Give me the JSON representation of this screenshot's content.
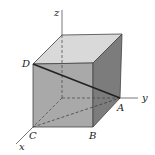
{
  "figure": {
    "type": "3d-cube-diagram",
    "axes": {
      "x": "x",
      "y": "y",
      "z": "z"
    },
    "points": {
      "A": "A",
      "B": "B",
      "C": "C",
      "D": "D"
    },
    "segments": [
      "DA",
      "CA"
    ],
    "colors": {
      "top_face": "#d9d9d9",
      "front_face": "#a9a9a9",
      "right_face": "#7c7c7c",
      "edge": "#333333",
      "diagonal": "#222222",
      "axis": "#555555"
    }
  }
}
